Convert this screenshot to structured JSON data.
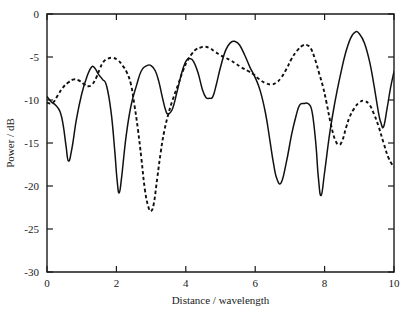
{
  "figure": {
    "title": "",
    "background": "#ffffff",
    "ink_color": "#111111"
  },
  "axes": {
    "x_title": "Distance / wavelength",
    "y_title": "Power / dB",
    "x_ticks": [
      "0",
      "2",
      "4",
      "6",
      "8",
      "10"
    ],
    "y_ticks": [
      "0",
      "-5",
      "-10",
      "-15",
      "-20",
      "-25",
      "-30"
    ]
  },
  "chart_data": {
    "type": "line",
    "title": "",
    "xlabel": "Distance / wavelength",
    "ylabel": "Power / dB",
    "xlim": [
      0,
      10
    ],
    "ylim": [
      -30,
      0
    ],
    "xticks": [
      0,
      2,
      4,
      6,
      8,
      10
    ],
    "yticks": [
      -30,
      -25,
      -20,
      -15,
      -10,
      -5,
      0
    ],
    "grid": false,
    "legend": false,
    "legend_position": "none",
    "series": [
      {
        "name": "solid",
        "style": "solid",
        "color": "#111111",
        "x": [
          0.0,
          0.12,
          0.25,
          0.38,
          0.47,
          0.55,
          0.62,
          0.72,
          0.85,
          1.0,
          1.15,
          1.28,
          1.38,
          1.48,
          1.6,
          1.72,
          1.85,
          1.95,
          2.02,
          2.08,
          2.15,
          2.28,
          2.42,
          2.58,
          2.72,
          2.88,
          3.0,
          3.12,
          3.22,
          3.32,
          3.42,
          3.5,
          3.62,
          3.75,
          3.9,
          4.02,
          4.12,
          4.22,
          4.35,
          4.48,
          4.58,
          4.68,
          4.78,
          4.88,
          5.0,
          5.15,
          5.3,
          5.42,
          5.55,
          5.7,
          5.85,
          6.0,
          6.15,
          6.3,
          6.42,
          6.52,
          6.62,
          6.75,
          6.9,
          7.05,
          7.18,
          7.28,
          7.4,
          7.55,
          7.65,
          7.75,
          7.82,
          7.9,
          8.0,
          8.15,
          8.3,
          8.45,
          8.6,
          8.75,
          8.88,
          9.0,
          9.15,
          9.3,
          9.42,
          9.55,
          9.62,
          9.7,
          9.8,
          9.9,
          10.0
        ],
        "y": [
          -9.6,
          -10.2,
          -10.6,
          -11.4,
          -13.0,
          -15.4,
          -17.1,
          -15.6,
          -12.2,
          -9.3,
          -7.3,
          -6.2,
          -6.3,
          -7.0,
          -7.6,
          -8.4,
          -11.5,
          -15.8,
          -19.3,
          -20.8,
          -19.0,
          -14.2,
          -10.7,
          -8.3,
          -6.6,
          -6.0,
          -6.0,
          -6.6,
          -7.8,
          -9.6,
          -11.2,
          -11.6,
          -11.0,
          -9.0,
          -6.6,
          -5.4,
          -5.2,
          -5.5,
          -6.8,
          -8.8,
          -9.7,
          -9.8,
          -9.6,
          -8.2,
          -6.2,
          -4.2,
          -3.3,
          -3.2,
          -3.6,
          -4.8,
          -6.2,
          -7.4,
          -9.0,
          -11.6,
          -14.6,
          -17.2,
          -19.1,
          -19.6,
          -17.2,
          -14.0,
          -11.8,
          -10.6,
          -10.4,
          -10.5,
          -11.6,
          -15.2,
          -19.0,
          -21.1,
          -18.4,
          -13.8,
          -10.2,
          -7.2,
          -4.6,
          -2.8,
          -2.1,
          -2.3,
          -3.4,
          -5.6,
          -8.2,
          -11.4,
          -12.6,
          -13.1,
          -11.0,
          -8.6,
          -6.7
        ]
      },
      {
        "name": "dashed",
        "style": "dashed",
        "color": "#111111",
        "x": [
          0.0,
          0.1,
          0.2,
          0.32,
          0.45,
          0.6,
          0.78,
          0.95,
          1.08,
          1.18,
          1.3,
          1.42,
          1.52,
          1.62,
          1.75,
          1.9,
          2.05,
          2.18,
          2.3,
          2.42,
          2.52,
          2.62,
          2.72,
          2.82,
          2.92,
          3.0,
          3.08,
          3.18,
          3.28,
          3.38,
          3.5,
          3.62,
          3.78,
          3.92,
          4.05,
          4.18,
          4.3,
          4.42,
          4.55,
          4.7,
          4.85,
          5.0,
          5.15,
          5.3,
          5.45,
          5.6,
          5.78,
          5.95,
          6.12,
          6.28,
          6.45,
          6.6,
          6.75,
          6.9,
          7.05,
          7.2,
          7.35,
          7.48,
          7.6,
          7.72,
          7.85,
          7.95,
          8.05,
          8.18,
          8.3,
          8.42,
          8.52,
          8.62,
          8.72,
          8.85,
          9.0,
          9.15,
          9.3,
          9.42,
          9.55,
          9.7,
          9.85,
          10.0
        ],
        "y": [
          -10.3,
          -10.4,
          -10.2,
          -9.4,
          -8.6,
          -8.0,
          -7.6,
          -7.8,
          -8.2,
          -8.4,
          -8.2,
          -7.4,
          -6.4,
          -5.6,
          -5.2,
          -5.1,
          -5.4,
          -6.0,
          -6.8,
          -8.2,
          -10.6,
          -13.4,
          -16.8,
          -20.4,
          -22.4,
          -22.9,
          -22.0,
          -19.0,
          -16.0,
          -13.6,
          -11.6,
          -10.0,
          -8.2,
          -6.6,
          -5.4,
          -4.6,
          -4.1,
          -3.9,
          -3.8,
          -4.0,
          -4.4,
          -4.8,
          -5.1,
          -5.4,
          -5.8,
          -6.2,
          -6.6,
          -7.0,
          -7.6,
          -8.0,
          -8.2,
          -8.0,
          -7.4,
          -6.4,
          -5.2,
          -4.3,
          -3.7,
          -3.6,
          -4.0,
          -5.2,
          -7.0,
          -8.4,
          -10.2,
          -12.8,
          -14.6,
          -15.2,
          -14.6,
          -13.2,
          -12.0,
          -11.0,
          -10.3,
          -10.1,
          -10.6,
          -11.6,
          -13.0,
          -15.0,
          -16.8,
          -17.8
        ]
      }
    ]
  }
}
